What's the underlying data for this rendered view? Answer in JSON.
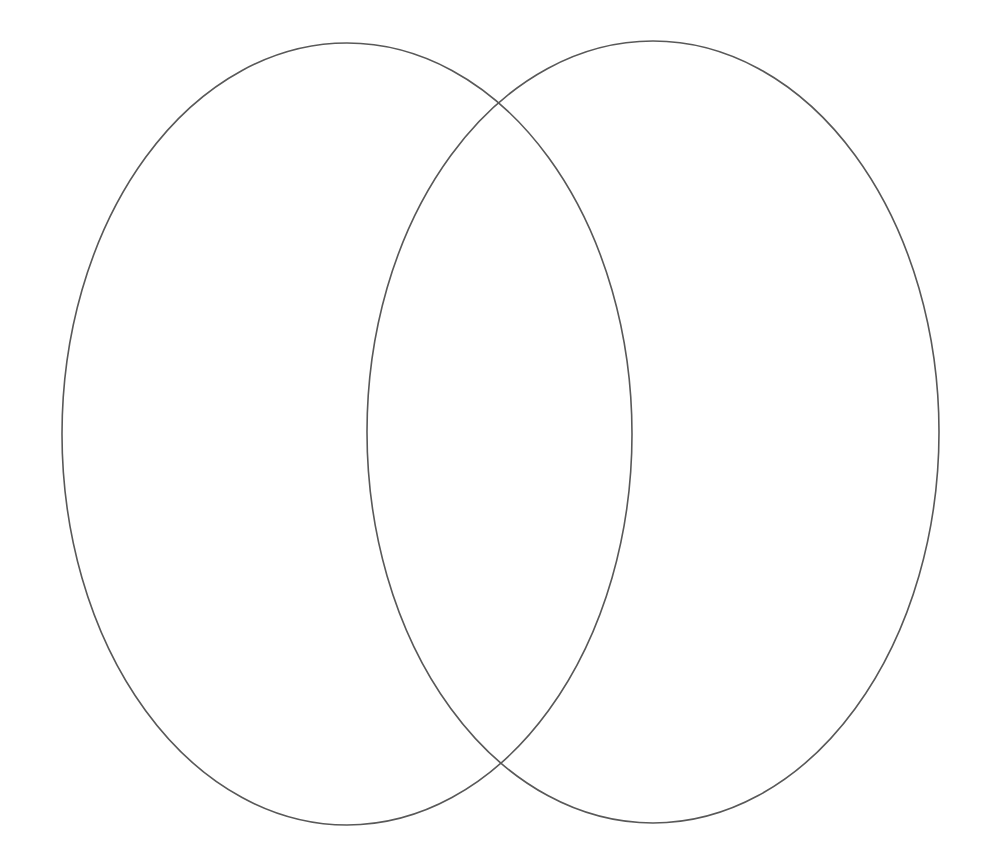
{
  "document": {
    "title": "Venn Diagram Template",
    "kind": "two-set-venn-diagram",
    "background_color": "#ffffff",
    "width": 999,
    "height": 861
  },
  "diagram": {
    "stroke_color": "#585858",
    "stroke_width": 1.6,
    "fill": "none",
    "shapes": [
      {
        "name": "left-set-ellipse",
        "label": "",
        "cx": 347,
        "cy": 434,
        "rx": 285,
        "ry": 391
      },
      {
        "name": "right-set-ellipse",
        "label": "",
        "cx": 653,
        "cy": 432,
        "rx": 286,
        "ry": 391
      }
    ],
    "intersection_points": [
      {
        "x": 498,
        "y": 103
      },
      {
        "x": 502,
        "y": 765
      }
    ],
    "regions": [
      {
        "name": "left-only-region",
        "label": "",
        "cx": 215,
        "cy": 434
      },
      {
        "name": "intersection-region",
        "label": "",
        "cx": 500,
        "cy": 434
      },
      {
        "name": "right-only-region",
        "label": "",
        "cx": 785,
        "cy": 432
      }
    ]
  }
}
